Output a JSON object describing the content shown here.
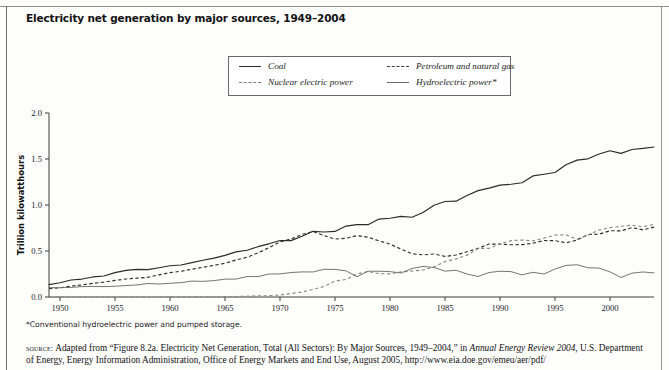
{
  "header": {
    "title": "Electricity net generation by major sources, 1949–2004"
  },
  "legend": {
    "items": [
      {
        "label": "Coal",
        "style": "solid",
        "icon": "legend-line-solid"
      },
      {
        "label": "Petroleum and natural gas",
        "style": "dashed",
        "icon": "legend-line-dashed"
      },
      {
        "label": "Nuclear electric power",
        "style": "dotted",
        "icon": "legend-line-dotted"
      },
      {
        "label": "Hydroelectric power*",
        "style": "solid-thin",
        "icon": "legend-line-thin"
      }
    ]
  },
  "notes": {
    "footnote": "*Conventional hydroelectric power and pumped storage.",
    "source_prefix": "source:",
    "source_part1": " Adapted from “Figure 8.2a. Electricity Net Generation, Total (All Sectors): By Major Sources, 1949–2004,” in ",
    "source_italic": "Annual Energy Review 2004",
    "source_part2": ", U.S. Department of Energy, Energy Information Administration, Office of Energy Markets and End Use, August 2005, http://www.eia.doe.gov/emeu/aer/pdf/"
  },
  "chart_data": {
    "type": "line",
    "title": "Electricity net generation by major sources, 1949–2004",
    "xlabel": "",
    "ylabel": "Trillion kilowatthours",
    "xlim": [
      1949,
      2004
    ],
    "ylim": [
      0.0,
      2.0
    ],
    "grid": false,
    "legend_position": "top-center",
    "xticks": [
      1950,
      1955,
      1960,
      1965,
      1970,
      1975,
      1980,
      1985,
      1990,
      1995,
      2000
    ],
    "xticklabels": [
      "1950",
      "1955",
      "1960",
      "1965",
      "1970",
      "1975",
      "1980",
      "1985",
      "1990",
      "1995",
      "2000"
    ],
    "yticks": [
      0.0,
      0.5,
      1.0,
      1.5,
      2.0
    ],
    "yticklabels": [
      "0.0",
      "0.5",
      "1.0",
      "1.5",
      "2.0"
    ],
    "x": [
      1949,
      1950,
      1951,
      1952,
      1953,
      1954,
      1955,
      1956,
      1957,
      1958,
      1959,
      1960,
      1961,
      1962,
      1963,
      1964,
      1965,
      1966,
      1967,
      1968,
      1969,
      1970,
      1971,
      1972,
      1973,
      1974,
      1975,
      1976,
      1977,
      1978,
      1979,
      1980,
      1981,
      1982,
      1983,
      1984,
      1985,
      1986,
      1987,
      1988,
      1989,
      1990,
      1991,
      1992,
      1993,
      1994,
      1995,
      1996,
      1997,
      1998,
      1999,
      2000,
      2001,
      2002,
      2003,
      2004
    ],
    "series": [
      {
        "name": "Coal",
        "style": "solid",
        "values": [
          0.135,
          0.155,
          0.185,
          0.195,
          0.218,
          0.228,
          0.265,
          0.289,
          0.301,
          0.297,
          0.318,
          0.34,
          0.348,
          0.373,
          0.4,
          0.422,
          0.452,
          0.49,
          0.508,
          0.547,
          0.578,
          0.614,
          0.613,
          0.661,
          0.714,
          0.706,
          0.713,
          0.771,
          0.786,
          0.786,
          0.847,
          0.856,
          0.876,
          0.867,
          0.918,
          0.997,
          1.038,
          1.042,
          1.104,
          1.156,
          1.184,
          1.216,
          1.225,
          1.242,
          1.316,
          1.334,
          1.353,
          1.437,
          1.488,
          1.502,
          1.554,
          1.59,
          1.561,
          1.603,
          1.615,
          1.63
        ]
      },
      {
        "name": "Petroleum and natural gas",
        "style": "dashed",
        "values": [
          0.09,
          0.1,
          0.118,
          0.132,
          0.148,
          0.162,
          0.18,
          0.196,
          0.205,
          0.214,
          0.241,
          0.265,
          0.28,
          0.302,
          0.323,
          0.344,
          0.366,
          0.402,
          0.432,
          0.479,
          0.536,
          0.599,
          0.631,
          0.68,
          0.712,
          0.667,
          0.63,
          0.638,
          0.667,
          0.65,
          0.61,
          0.575,
          0.521,
          0.47,
          0.458,
          0.467,
          0.441,
          0.456,
          0.492,
          0.528,
          0.576,
          0.574,
          0.568,
          0.569,
          0.584,
          0.614,
          0.612,
          0.589,
          0.618,
          0.679,
          0.683,
          0.72,
          0.719,
          0.754,
          0.73,
          0.76
        ]
      },
      {
        "name": "Nuclear electric power",
        "style": "dotted",
        "values": [
          0.0,
          0.0,
          0.0,
          0.0,
          0.0,
          0.0,
          0.0,
          0.0,
          0.0,
          0.0,
          0.0,
          0.001,
          0.002,
          0.002,
          0.003,
          0.003,
          0.004,
          0.006,
          0.008,
          0.013,
          0.014,
          0.022,
          0.038,
          0.054,
          0.083,
          0.114,
          0.173,
          0.191,
          0.251,
          0.276,
          0.255,
          0.251,
          0.273,
          0.283,
          0.294,
          0.328,
          0.384,
          0.414,
          0.455,
          0.527,
          0.529,
          0.577,
          0.613,
          0.619,
          0.61,
          0.64,
          0.673,
          0.675,
          0.629,
          0.674,
          0.728,
          0.754,
          0.769,
          0.78,
          0.764,
          0.789
        ]
      },
      {
        "name": "Hydroelectric power*",
        "style": "solid-thin",
        "values": [
          0.102,
          0.101,
          0.104,
          0.113,
          0.115,
          0.113,
          0.117,
          0.125,
          0.131,
          0.147,
          0.141,
          0.149,
          0.156,
          0.173,
          0.17,
          0.178,
          0.194,
          0.195,
          0.222,
          0.222,
          0.25,
          0.251,
          0.266,
          0.273,
          0.272,
          0.301,
          0.3,
          0.284,
          0.22,
          0.28,
          0.28,
          0.276,
          0.261,
          0.31,
          0.332,
          0.321,
          0.281,
          0.291,
          0.25,
          0.223,
          0.266,
          0.28,
          0.276,
          0.24,
          0.269,
          0.25,
          0.304,
          0.343,
          0.351,
          0.318,
          0.314,
          0.273,
          0.212,
          0.259,
          0.272,
          0.262
        ]
      }
    ]
  }
}
